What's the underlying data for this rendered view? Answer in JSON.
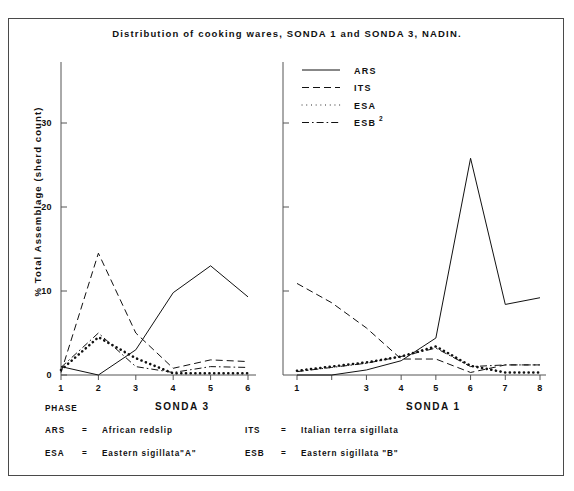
{
  "figure": {
    "title": "Distribution of cooking wares, SONDA 1 and SONDA 3, NADIN.",
    "ylabel": "% Total Assemblage (sherd count)",
    "phase_label": "PHASE",
    "panel_left_name": "SONDA 3",
    "panel_right_name": "SONDA 1"
  },
  "legend": {
    "items": [
      {
        "label": "ARS",
        "style": "solid",
        "sup": ""
      },
      {
        "label": "ITS",
        "style": "dashed",
        "sup": ""
      },
      {
        "label": "ESA",
        "style": "dotted",
        "sup": ""
      },
      {
        "label": "ESB",
        "style": "dashdot",
        "sup": "2"
      }
    ]
  },
  "key": {
    "rows": [
      {
        "abbr": "ARS",
        "eq": "=",
        "definition": "African redslip"
      },
      {
        "abbr": "ITS",
        "eq": "=",
        "definition": "Italian terra sigillata"
      },
      {
        "abbr": "ESA",
        "eq": "=",
        "definition": "Eastern sigillata\"A\""
      },
      {
        "abbr": "ESB",
        "eq": "=",
        "definition": "Eastern sigillata \"B\""
      }
    ]
  },
  "chart_data": [
    {
      "type": "line",
      "panel": "SONDA 3",
      "title": "Distribution of cooking wares, SONDA 1 and SONDA 3, NADIN.",
      "xlabel": "PHASE",
      "ylabel": "% Total Assemblage (sherd count)",
      "categories": [
        1,
        2,
        3,
        4,
        5,
        6
      ],
      "xticklabels": [
        "1",
        "2",
        "3",
        "4",
        "5",
        "6"
      ],
      "yticks": [
        0,
        10,
        20,
        30
      ],
      "ylim": [
        0,
        35
      ],
      "grid": false,
      "legend_position": "top-center",
      "series": [
        {
          "name": "ARS",
          "style": "solid",
          "values": [
            1.0,
            0.0,
            3.0,
            9.8,
            13.0,
            9.3
          ]
        },
        {
          "name": "ITS",
          "style": "dashed",
          "values": [
            0.3,
            14.5,
            5.0,
            0.8,
            1.8,
            1.6
          ]
        },
        {
          "name": "ESA",
          "style": "dotted",
          "values": [
            0.6,
            4.5,
            2.0,
            0.2,
            0.2,
            0.2
          ]
        },
        {
          "name": "ESB2",
          "style": "dashdot",
          "values": [
            0.9,
            5.0,
            1.0,
            0.3,
            1.0,
            0.9
          ]
        }
      ]
    },
    {
      "type": "line",
      "panel": "SONDA 1",
      "xlabel": "PHASE",
      "ylabel": "% Total Assemblage (sherd count)",
      "categories": [
        1,
        2,
        3,
        4,
        5,
        6,
        7,
        8
      ],
      "xticklabels": [
        "1",
        "",
        "3",
        "4",
        "5",
        "6",
        "7",
        "8"
      ],
      "yticks": [
        0,
        10,
        20,
        30
      ],
      "ylim": [
        0,
        35
      ],
      "grid": false,
      "series": [
        {
          "name": "ARS",
          "style": "solid",
          "values": [
            0.0,
            0.0,
            0.6,
            1.7,
            4.4,
            25.8,
            8.4,
            9.2
          ]
        },
        {
          "name": "ITS",
          "style": "dashed",
          "values": [
            10.9,
            8.6,
            5.6,
            1.9,
            1.9,
            0.3,
            1.2,
            1.2
          ]
        },
        {
          "name": "ESA",
          "style": "dotted",
          "values": [
            0.5,
            1.0,
            1.5,
            2.2,
            3.4,
            1.1,
            0.3,
            0.3
          ]
        },
        {
          "name": "ESB2",
          "style": "dashdot",
          "values": [
            0.4,
            0.9,
            1.4,
            2.2,
            3.2,
            1.0,
            1.2,
            1.2
          ]
        }
      ]
    }
  ]
}
